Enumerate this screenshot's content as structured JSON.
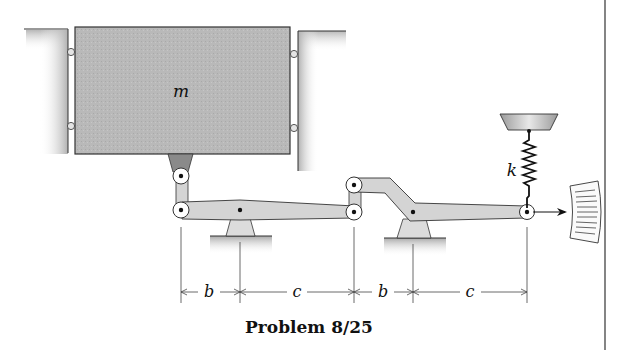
{
  "figure": {
    "caption": "Problem 8/25",
    "mass_label": "m",
    "spring_label": "k",
    "dimensions": [
      {
        "label": "b",
        "from_x": 181,
        "to_x": 240
      },
      {
        "label": "c",
        "from_x": 240,
        "to_x": 354
      },
      {
        "label": "b",
        "from_x": 354,
        "to_x": 413
      },
      {
        "label": "c",
        "from_x": 413,
        "to_x": 527
      }
    ]
  },
  "colors": {
    "mass_fill": "#b8b8b8",
    "link_fill": "#d4d4d4",
    "bracket_fill": "#8a8a8a",
    "stroke": "#222222",
    "ground_shade": "#c8c8c8"
  }
}
